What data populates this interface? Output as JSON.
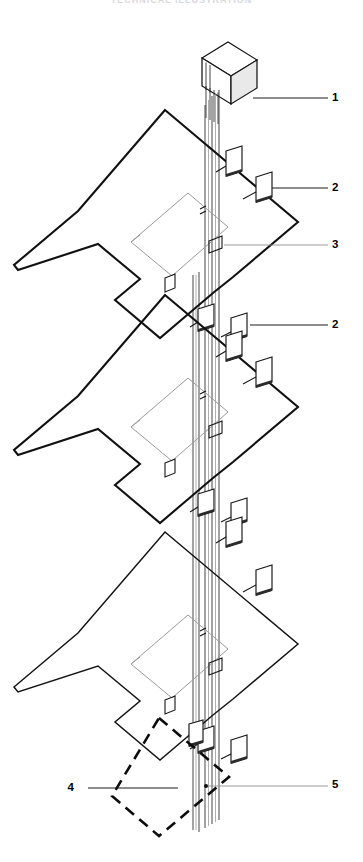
{
  "figure": {
    "title_strip": "TECHNICAL ILLUSTRATION",
    "type": "isometric-riser-diagram",
    "background_color": "#ffffff",
    "line_color": "#111111",
    "accent_gray": "#9a9a9a",
    "width": 363,
    "height": 862
  },
  "callouts": [
    {
      "id": "callout-1",
      "label": "1",
      "x": 336,
      "y": 98,
      "target": "control-panel-unit"
    },
    {
      "id": "callout-2a",
      "label": "2",
      "x": 336,
      "y": 188,
      "target": "wall-mounted-device"
    },
    {
      "id": "callout-3",
      "label": "3",
      "x": 336,
      "y": 245,
      "target": "vertical-riser-cable"
    },
    {
      "id": "callout-2b",
      "label": "2",
      "x": 336,
      "y": 325,
      "target": "wall-mounted-device"
    },
    {
      "id": "callout-4",
      "label": "4",
      "x": 78,
      "y": 788,
      "target": "dashed-enclosure"
    },
    {
      "id": "callout-5",
      "label": "5",
      "x": 336,
      "y": 785,
      "target": "connection-point"
    }
  ],
  "floors": [
    {
      "id": "floor-upper",
      "name": "Upper Floor Plan",
      "device_count": 4
    },
    {
      "id": "floor-middle",
      "name": "Middle Floor Plan",
      "device_count": 4
    },
    {
      "id": "floor-lower",
      "name": "Lower Floor Plan",
      "device_count": 4
    }
  ],
  "components": {
    "control_panel": {
      "name": "Control Panel Unit",
      "position": "top"
    },
    "riser_bundle": {
      "name": "Vertical Riser Cable Bundle",
      "line_count": 5
    },
    "dashed_enclosure": {
      "name": "Dashed Enclosure Boundary",
      "style": "dashed"
    },
    "inner_room": {
      "name": "Inner Room Outline",
      "style": "light-gray"
    }
  }
}
